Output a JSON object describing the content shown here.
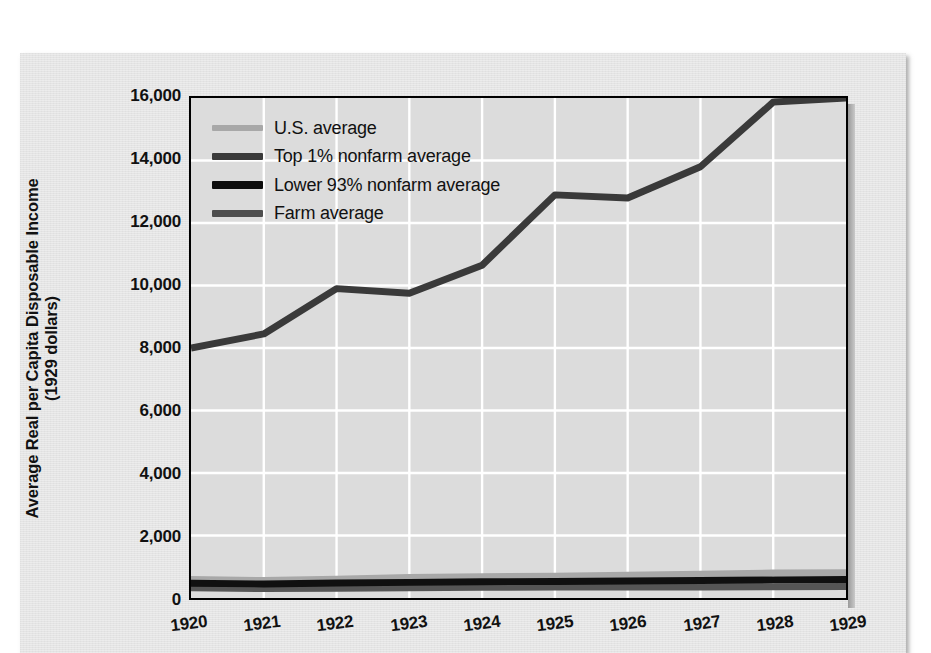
{
  "chart_data": {
    "type": "line",
    "title": "",
    "xlabel": "",
    "ylabel": "Average Real per Capita Disposable Income (1929 dollars)",
    "ylabel_line1": "Average Real per Capita Disposable Income",
    "ylabel_line2": "(1929 dollars)",
    "x": [
      1920,
      1921,
      1922,
      1923,
      1924,
      1925,
      1926,
      1927,
      1928,
      1929
    ],
    "categories": [
      "1920",
      "1921",
      "1922",
      "1923",
      "1924",
      "1925",
      "1926",
      "1927",
      "1928",
      "1929"
    ],
    "xlim": [
      1920,
      1929
    ],
    "ylim": [
      0,
      16000
    ],
    "yticks": [
      0,
      2000,
      4000,
      6000,
      8000,
      10000,
      12000,
      14000,
      16000
    ],
    "ytick_labels": [
      "0",
      "2,000",
      "4,000",
      "6,000",
      "8,000",
      "10,000",
      "12,000",
      "14,000",
      "16,000"
    ],
    "grid": true,
    "grid_color": "#ffffff",
    "plot_background": "#dcdcdc",
    "legend_position": "upper left",
    "series": [
      {
        "name": "U.S. average",
        "color": "#a8a8a8",
        "width": 7,
        "values": [
          590,
          560,
          600,
          660,
          680,
          700,
          730,
          760,
          800,
          810
        ]
      },
      {
        "name": "Top 1% nonfarm average",
        "color": "#3a3a3a",
        "width": 7,
        "values": [
          8000,
          8450,
          9900,
          9750,
          10650,
          12900,
          12800,
          13800,
          15870,
          16000
        ]
      },
      {
        "name": "Lower 93% nonfarm average",
        "color": "#101010",
        "width": 7,
        "values": [
          470,
          450,
          480,
          500,
          520,
          530,
          545,
          560,
          580,
          590
        ]
      },
      {
        "name": "Farm average",
        "color": "#555555",
        "width": 7,
        "values": [
          330,
          300,
          310,
          330,
          345,
          350,
          350,
          355,
          360,
          370
        ]
      }
    ]
  },
  "legend": {
    "items": [
      {
        "label": "U.S. average",
        "color": "#a8a8a8",
        "thickness": 6
      },
      {
        "label": "Top 1% nonfarm average",
        "color": "#3a3a3a",
        "thickness": 7
      },
      {
        "label": "Lower 93% nonfarm average",
        "color": "#0d0d0d",
        "thickness": 8
      },
      {
        "label": "Farm average",
        "color": "#4e4e4e",
        "thickness": 7
      }
    ]
  }
}
